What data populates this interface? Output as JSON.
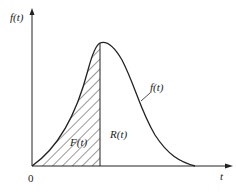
{
  "diagram": {
    "y_axis_label": "f(t)",
    "x_axis_label": "t",
    "origin_label": "0",
    "curve_label": "f(t)",
    "shaded_region_label": "F(t)",
    "unshaded_region_label": "R(t)",
    "colors": {
      "stroke": "#222222",
      "background": "#ffffff"
    }
  }
}
